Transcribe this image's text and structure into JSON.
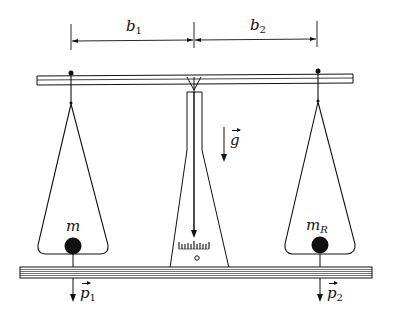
{
  "diagram": {
    "dimensions": {
      "left_arm": {
        "symbol": "b",
        "subscript": "1"
      },
      "right_arm": {
        "symbol": "b",
        "subscript": "2"
      }
    },
    "gravity": {
      "symbol": "g"
    },
    "left_pan": {
      "mass_label": "m",
      "force": {
        "symbol": "p",
        "subscript": "1"
      }
    },
    "right_pan": {
      "mass_label": "m",
      "mass_subscript": "R",
      "force": {
        "symbol": "p",
        "subscript": "2"
      }
    },
    "colors": {
      "ink": "#111111",
      "background": "#ffffff"
    }
  }
}
